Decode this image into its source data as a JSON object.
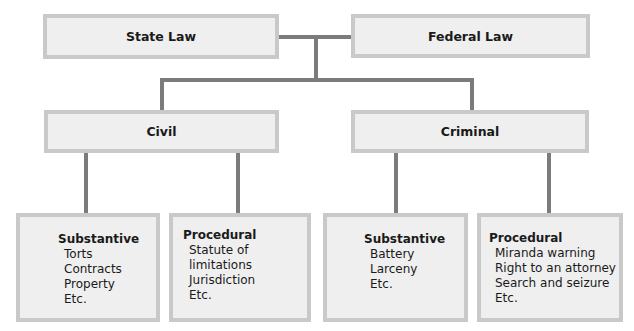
{
  "diagram": {
    "level1": {
      "left": "State Law",
      "right": "Federal Law"
    },
    "level2": {
      "left": "Civil",
      "right": "Criminal"
    },
    "leaves": [
      {
        "heading": "Substantive",
        "items": [
          "Torts",
          "Contracts",
          "Property",
          "Etc."
        ]
      },
      {
        "heading": "Procedural",
        "items": [
          "Statute of limitations",
          "Jurisdiction",
          "Etc."
        ]
      },
      {
        "heading": "Substantive",
        "items": [
          "Battery",
          "Larceny",
          "Etc."
        ]
      },
      {
        "heading": "Procedural",
        "items": [
          "Miranda warning",
          "Right to an attorney",
          "Search and seizure",
          "Etc."
        ]
      }
    ],
    "colors": {
      "box_fill": "#efefef",
      "box_border": "#c9c9c9",
      "connector": "#7b7b7b"
    }
  }
}
